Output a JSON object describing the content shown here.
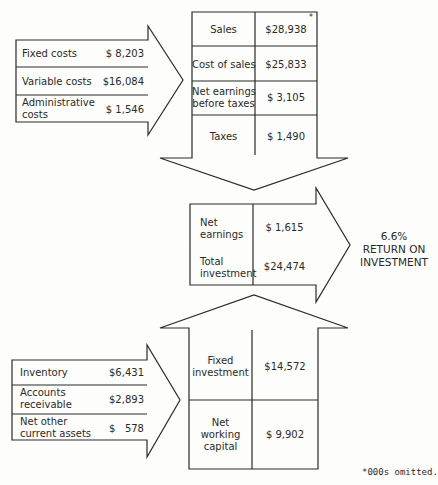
{
  "footnote": "*000s omitted.",
  "asterisk": "*",
  "costs": {
    "rows": [
      {
        "label": "Fixed costs",
        "value": "$ 8,203"
      },
      {
        "label": "Variable costs",
        "value": "$16,084"
      },
      {
        "label_line1": "Administrative",
        "label_line2": "costs",
        "value": "$ 1,546"
      }
    ]
  },
  "income": {
    "rows": [
      {
        "label": "Sales",
        "value": "$28,938"
      },
      {
        "label": "Cost of sales",
        "value": "$25,833"
      },
      {
        "label_line1": "Net earnings",
        "label_line2": "before taxes",
        "value": "$ 3,105"
      },
      {
        "label": "Taxes",
        "value": "$ 1,490"
      }
    ]
  },
  "result": {
    "net_earnings_line1": "Net",
    "net_earnings_line2": "earnings",
    "net_earnings_value": "$ 1,615",
    "total_investment_line1": "Total",
    "total_investment_line2": "investment",
    "total_investment_value": "$24,474",
    "roi_percent": "6.6%",
    "roi_line1": "RETURN ON",
    "roi_line2": "INVESTMENT"
  },
  "investment": {
    "fixed_line1": "Fixed",
    "fixed_line2": "investment",
    "fixed_value": "$14,572",
    "nwc_line1": "Net",
    "nwc_line2": "working",
    "nwc_line3": "capital",
    "nwc_value": "$ 9,902"
  },
  "current_assets": {
    "rows": [
      {
        "label": "Inventory",
        "value": "$6,431"
      },
      {
        "label_line1": "Accounts",
        "label_line2": "receivable",
        "value": "$2,893"
      },
      {
        "label_line1": "Net other",
        "label_line2": "current assets",
        "value": "$   578"
      }
    ]
  }
}
